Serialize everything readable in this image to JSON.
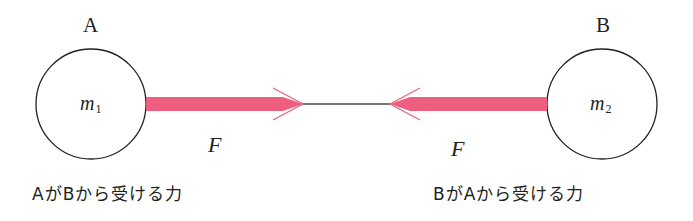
{
  "diagram": {
    "type": "action-reaction-forces",
    "colors": {
      "arrow": "#ee5f7f",
      "outline": "#231f20",
      "background": "#ffffff"
    },
    "bodyA": {
      "label": "A",
      "mass_symbol": "m",
      "mass_subscript": "1",
      "force_label": "F",
      "caption": "AがBから受ける力"
    },
    "bodyB": {
      "label": "B",
      "mass_symbol": "m",
      "mass_subscript": "2",
      "force_label": "F",
      "caption": "BがAから受ける力"
    }
  }
}
